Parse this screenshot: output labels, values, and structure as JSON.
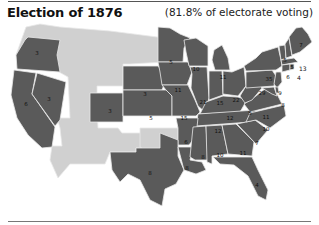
{
  "header": {
    "title": "Election of 1876",
    "subtitle": "(81.8% of electorate voting)"
  },
  "map": {
    "colors": {
      "state": "#5a5a5a",
      "territory": "#d0d0d0",
      "border": "#e8e8e8"
    },
    "states": [
      {
        "name": "Washington Territory",
        "type": "territory"
      },
      {
        "name": "Oregon",
        "ev": "3"
      },
      {
        "name": "California",
        "ev": "6"
      },
      {
        "name": "Nevada",
        "ev": "3"
      },
      {
        "name": "Colorado",
        "ev": "3"
      },
      {
        "name": "Nebraska",
        "ev": "3"
      },
      {
        "name": "Kansas",
        "ev": "5"
      },
      {
        "name": "Minnesota",
        "ev": "5"
      },
      {
        "name": "Iowa",
        "ev": "11"
      },
      {
        "name": "Missouri",
        "ev": "15"
      },
      {
        "name": "Wisconsin",
        "ev": "10"
      },
      {
        "name": "Illinois",
        "ev": "21"
      },
      {
        "name": "Michigan",
        "ev": "11"
      },
      {
        "name": "Indiana",
        "ev": "15"
      },
      {
        "name": "Ohio",
        "ev": "22"
      },
      {
        "name": "Kentucky",
        "ev": "12"
      },
      {
        "name": "Tennessee",
        "ev": "12"
      },
      {
        "name": "Arkansas",
        "ev": "6"
      },
      {
        "name": "Texas",
        "ev": "8"
      },
      {
        "name": "Louisiana",
        "ev": "8"
      },
      {
        "name": "Mississippi",
        "ev": "8"
      },
      {
        "name": "Alabama",
        "ev": "10"
      },
      {
        "name": "Georgia",
        "ev": "11"
      },
      {
        "name": "Florida",
        "ev": "4"
      },
      {
        "name": "South Carolina",
        "ev": "7"
      },
      {
        "name": "North Carolina",
        "ev": "10"
      },
      {
        "name": "Virginia",
        "ev": "11"
      },
      {
        "name": "West Virginia",
        "ev": "5"
      },
      {
        "name": "Pennsylvania",
        "ev": "29"
      },
      {
        "name": "New York",
        "ev": "35"
      },
      {
        "name": "New Jersey",
        "ev": "9"
      },
      {
        "name": "Maryland",
        "ev": "8"
      },
      {
        "name": "Delaware",
        "ev": "3"
      },
      {
        "name": "Vermont",
        "ev": "5"
      },
      {
        "name": "New Hampshire",
        "ev": "5"
      },
      {
        "name": "Maine",
        "ev": "7"
      },
      {
        "name": "Massachusetts",
        "ev": "13"
      },
      {
        "name": "Rhode Island",
        "ev": "4"
      },
      {
        "name": "Connecticut",
        "ev": "6"
      }
    ],
    "labels": {
      "or": "3",
      "ca": "6",
      "nv": "3",
      "co": "3",
      "ne": "3",
      "ks": "5",
      "mn": "5",
      "ia": "11",
      "mo": "15",
      "wi": "10",
      "il": "21",
      "mi": "11",
      "in": "15",
      "oh": "22",
      "ky": "12",
      "tn": "12",
      "ar": "6",
      "tx": "8",
      "la": "8",
      "ms": "8",
      "al": "10",
      "ga": "11",
      "fl": "4",
      "sc": "7",
      "nc": "10",
      "va": "11",
      "wv": "5",
      "pa": "29",
      "ny": "35",
      "nj": "9",
      "md": "8",
      "vt": "5",
      "nh": "5",
      "me": "7",
      "ma": "13",
      "ri": "4",
      "ct": "6"
    }
  }
}
